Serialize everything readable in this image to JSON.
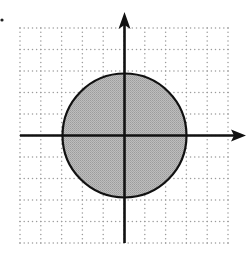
{
  "figure": {
    "width": 249,
    "height": 254,
    "colors": {
      "background": "#ffffff",
      "grid": "#9a9a9a",
      "axes": "#111111",
      "disk_fill": "#b3b3b3",
      "disk_stroke": "#111111"
    },
    "grid": {
      "x_left": 20,
      "x_right": 228,
      "y_top": 28,
      "y_bottom": 243,
      "columns": 10,
      "rows": 10,
      "minor_dot_subdivisions": 5
    },
    "origin": {
      "x": 124.5,
      "y": 135.5
    },
    "axes": {
      "x_axis": {
        "from_x": 20,
        "to_x": 246,
        "arrow": "right"
      },
      "y_axis": {
        "from_y": 243,
        "to_y": 12,
        "arrow": "up"
      }
    },
    "disk": {
      "center_units": [
        0,
        0
      ],
      "radius_units": 3,
      "radius_px": 62
    },
    "marker_dot": {
      "x": 2,
      "y": 20
    }
  }
}
